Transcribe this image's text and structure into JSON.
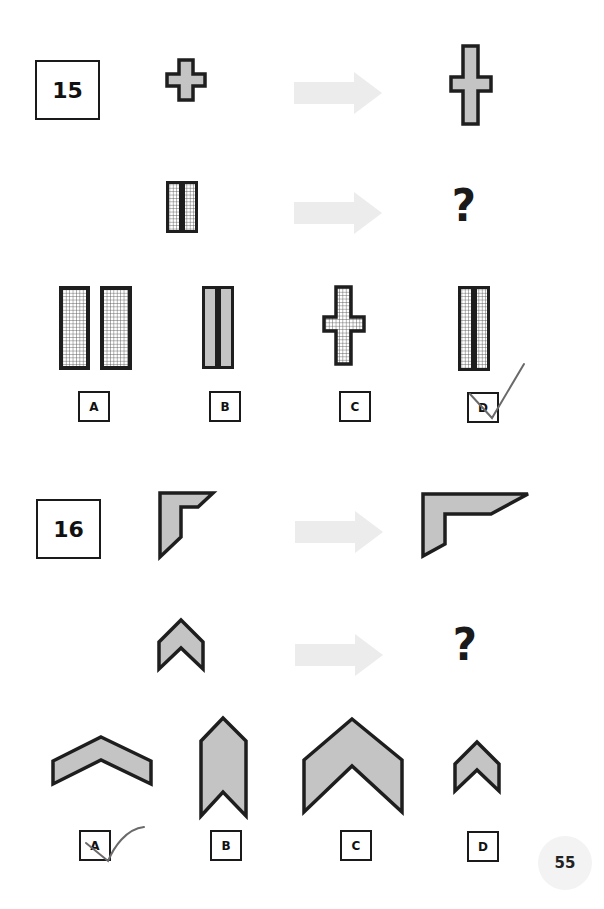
{
  "page": {
    "page_number": "55",
    "colors": {
      "shape_fill": "#c4c4c4",
      "shape_stroke": "#1e1e1e",
      "arrow_fill": "#ececec",
      "checkmark": "#6a6a6a"
    }
  },
  "questions": [
    {
      "number": "15",
      "row1": {
        "left_shape": "small-plus-cross-gray",
        "right_shape": "tall-latin-cross-gray"
      },
      "row2": {
        "left_shape": "two-narrow-grid-bars",
        "right_shape": "question-mark"
      },
      "question_mark": "?",
      "options": [
        {
          "label": "A",
          "shape": "two-wide-grid-bars",
          "marked": false
        },
        {
          "label": "B",
          "shape": "two-narrow-gray-bars",
          "marked": false
        },
        {
          "label": "C",
          "shape": "grid-latin-cross",
          "marked": false
        },
        {
          "label": "D",
          "shape": "two-tall-narrow-grid-bars",
          "marked": true
        }
      ]
    },
    {
      "number": "16",
      "row1": {
        "left_shape": "small-corner-bracket-gray",
        "right_shape": "wide-corner-bracket-gray"
      },
      "row2": {
        "left_shape": "small-chevron-up-gray",
        "right_shape": "question-mark"
      },
      "question_mark": "?",
      "options": [
        {
          "label": "A",
          "shape": "wide-flat-chevron",
          "marked": true
        },
        {
          "label": "B",
          "shape": "tall-narrow-chevron",
          "marked": false
        },
        {
          "label": "C",
          "shape": "large-chevron",
          "marked": false
        },
        {
          "label": "D",
          "shape": "small-chevron",
          "marked": false
        }
      ]
    }
  ]
}
